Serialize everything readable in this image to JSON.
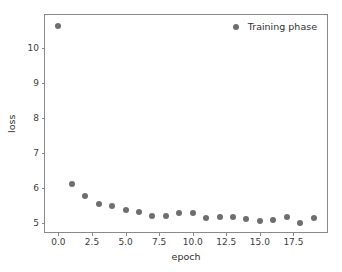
{
  "chart_data": {
    "type": "scatter",
    "title": "",
    "xlabel": "epoch",
    "ylabel": "loss",
    "xlim": [
      -1.0,
      20.0
    ],
    "ylim": [
      4.75,
      10.95
    ],
    "grid": false,
    "legend_position": "upper right",
    "marker_color": "#6e6e6e",
    "frame_color": "#8a8a8a",
    "background": "#ffffff",
    "xticks": [
      0.0,
      2.5,
      5.0,
      7.5,
      10.0,
      12.5,
      15.0,
      17.5
    ],
    "xticklabels": [
      "0.0",
      "2.5",
      "5.0",
      "7.5",
      "10.0",
      "12.5",
      "15.0",
      "17.5"
    ],
    "yticks": [
      5,
      6,
      7,
      8,
      9,
      10
    ],
    "yticklabels": [
      "5",
      "6",
      "7",
      "8",
      "9",
      "10"
    ],
    "series": [
      {
        "name": "Training phase",
        "x": [
          0,
          1,
          2,
          3,
          4,
          5,
          6,
          7,
          8,
          9,
          10,
          11,
          12,
          13,
          14,
          15,
          16,
          17,
          18,
          19
        ],
        "values": [
          10.65,
          6.13,
          5.78,
          5.54,
          5.48,
          5.38,
          5.31,
          5.22,
          5.2,
          5.28,
          5.3,
          5.15,
          5.17,
          5.17,
          5.11,
          5.06,
          5.08,
          5.19,
          5.0,
          5.14
        ]
      }
    ]
  },
  "legend": {
    "entries": [
      {
        "label": "Training phase",
        "marker": "circle",
        "color": "#6e6e6e"
      }
    ]
  }
}
